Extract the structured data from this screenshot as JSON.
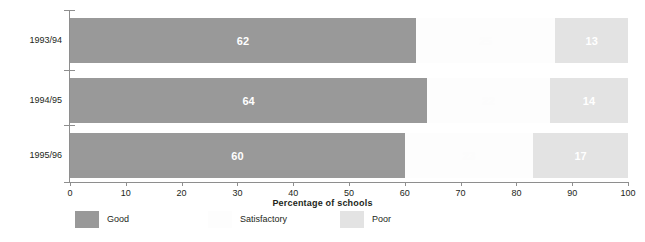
{
  "chart_data": {
    "type": "bar",
    "orientation": "horizontal",
    "stacked": true,
    "title": "",
    "xlabel": "Percentage of schools",
    "ylabel": "",
    "xlim": [
      0,
      100
    ],
    "xticks": [
      0,
      10,
      20,
      30,
      40,
      50,
      60,
      70,
      80,
      90,
      100
    ],
    "grid": false,
    "legend_position": "bottom",
    "categories": [
      "1993/94",
      "1994/95",
      "1995/96"
    ],
    "series": [
      {
        "name": "Good",
        "color": "#999999",
        "values": [
          62,
          64,
          60
        ],
        "labels": [
          "62",
          "64",
          "60"
        ]
      },
      {
        "name": "Satisfactory",
        "color": "#fdfdfd",
        "values": [
          25,
          22,
          23
        ],
        "labels": [
          "25",
          "22",
          "23"
        ]
      },
      {
        "name": "Poor",
        "color": "#e3e3e3",
        "values": [
          13,
          14,
          17
        ],
        "labels": [
          "13",
          "14",
          "17"
        ]
      }
    ]
  },
  "axis": {
    "x_title": "Percentage of schools",
    "tick_labels": [
      "0",
      "10",
      "20",
      "30",
      "40",
      "50",
      "60",
      "70",
      "80",
      "90",
      "100"
    ]
  },
  "categories": [
    "1993/94",
    "1994/95",
    "1995/96"
  ],
  "legend": {
    "items": [
      {
        "label": "Good"
      },
      {
        "label": "Satisfactory"
      },
      {
        "label": "Poor"
      }
    ]
  }
}
